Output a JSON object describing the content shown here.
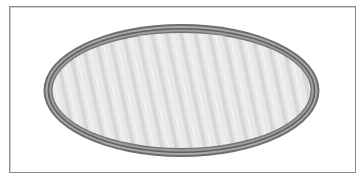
{
  "figure": {
    "shape": "ellipse",
    "frame": {
      "x": 9,
      "y": 6,
      "width": 347,
      "height": 167,
      "border_color": "#8a8a8a"
    },
    "ellipse": {
      "cx": 181.5,
      "cy": 90.5,
      "rx": 139,
      "ry": 67.5,
      "rings": [
        {
          "offset": 0,
          "color": "#6e6e6e",
          "width": 2
        },
        {
          "offset": 2.5,
          "color": "#a8a8a8",
          "width": 2
        },
        {
          "offset": 5,
          "color": "#5f5f5f",
          "width": 1.6
        },
        {
          "offset": 7,
          "color": "#9d9d9d",
          "width": 2
        },
        {
          "offset": 9,
          "color": "#747474",
          "width": 1.4
        }
      ],
      "fill_colors": [
        "#e9e9e9",
        "#d6d6d6"
      ]
    }
  }
}
